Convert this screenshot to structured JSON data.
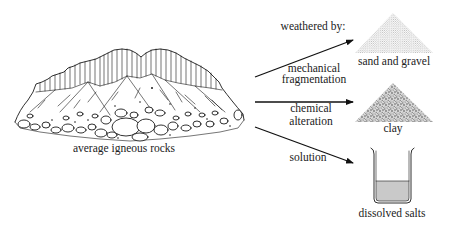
{
  "figure": {
    "source": {
      "label": "average igneous rocks"
    },
    "header": "weathered by:",
    "processes": [
      {
        "label_lines": [
          "mechanical",
          "fragmentation"
        ],
        "product": "sand and gravel"
      },
      {
        "label_lines": [
          "chemical",
          "alteration"
        ],
        "product": "clay"
      },
      {
        "label_lines": [
          "solution"
        ],
        "product": "dissolved salts"
      }
    ],
    "colors": {
      "ink": "#1a1a1a",
      "text": "#222222",
      "sand_fill": "#bdbdbd",
      "clay_fill": "#8a8a8a",
      "liquid_fill": "#c9c9c9"
    }
  }
}
